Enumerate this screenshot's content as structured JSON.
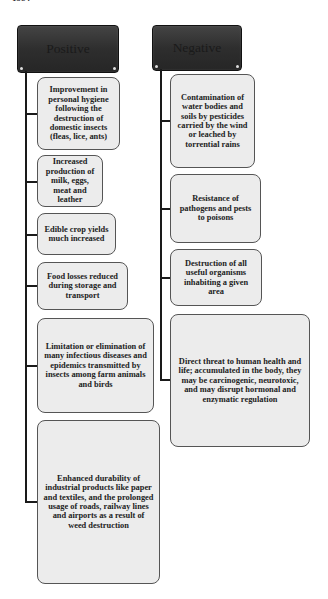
{
  "page_label": "1984",
  "positive": {
    "title": "Positive",
    "items": [
      "Improvement in personal hygiene following the destruction of domestic insects (fleas, lice, ants)",
      "Increased production of milk, eggs, meat and leather",
      "Edible crop yields much increased",
      "Food losses reduced during storage and transport",
      "Limitation or elimination of many infectious diseases and epidemics transmitted by insects among farm animals and birds",
      "Enhanced durability of industrial products like paper and textiles, and the prolonged usage of roads, railway lines and airports as a result of weed destruction"
    ]
  },
  "negative": {
    "title": "Negative",
    "items": [
      "Contamination of water bodies and soils by pesticides carried by the wind or leached by torrential rains",
      "Resistance of pathogens and pests to poisons",
      "Destruction of all useful organisms inhabiting a given area",
      "Direct threat to human health and life; accumulated in the body, they may be carcinogenic, neurotoxic, and may disrupt hormonal and enzymatic regulation"
    ]
  },
  "colors": {
    "header_fill": "#2e2e2e",
    "box_fill": "#ececec",
    "connector": "#1a1a1a"
  }
}
